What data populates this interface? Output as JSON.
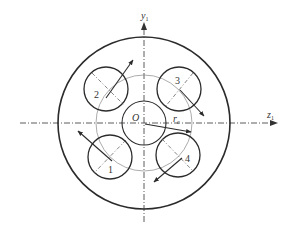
{
  "diagram": {
    "axes": {
      "vertical_label": "y",
      "vertical_subscript": "1",
      "horizontal_label": "z",
      "horizontal_subscript": "1"
    },
    "center_label": "O",
    "radius_label": "r",
    "radius_subscript": "c",
    "holes": [
      {
        "id": "1",
        "label": "1"
      },
      {
        "id": "2",
        "label": "2"
      },
      {
        "id": "3",
        "label": "3"
      },
      {
        "id": "4",
        "label": "4"
      }
    ],
    "colors": {
      "stroke": "#2b2b2b",
      "pitch_circle": "#888888",
      "background": "#ffffff"
    }
  }
}
